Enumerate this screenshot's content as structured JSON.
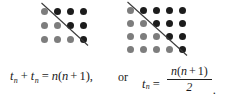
{
  "figure": {
    "kind": "proof-without-words-triangular-numbers",
    "colors": {
      "dot_light": "#7d7d7d",
      "dot_dark": "#1c1c1c",
      "line": "#3a3a3a",
      "background": "#ffffff",
      "text": "#1a1a1a"
    },
    "arrays": [
      {
        "name": "left-dot-array",
        "columns": 4,
        "rows": 3,
        "total_dots": 12,
        "light_dots": 6,
        "dark_dots": 6,
        "diagonal": "top-left to bottom-right"
      },
      {
        "name": "right-dot-array",
        "columns": 5,
        "rows": 4,
        "total_dots": 20,
        "light_dots": 10,
        "dark_dots": 10,
        "diagonal": "top-left to bottom-right"
      }
    ]
  },
  "equation": {
    "left": {
      "t1_base": "t",
      "t1_sub": "n",
      "plus": "+",
      "t2_base": "t",
      "t2_sub": "n",
      "equals": "=",
      "rhs_n": "n",
      "rhs_open": "(",
      "rhs_inner_n": "n",
      "rhs_plus": "+",
      "rhs_one": "1",
      "rhs_close": ")",
      "comma": ","
    },
    "or_label": "or",
    "right": {
      "t_base": "t",
      "t_sub": "n",
      "equals": "=",
      "numerator_n": "n",
      "numerator_open": "(",
      "numerator_inner_n": "n",
      "numerator_plus": "+",
      "numerator_one": "1",
      "numerator_close": ")",
      "denominator": "2",
      "period": "."
    }
  }
}
